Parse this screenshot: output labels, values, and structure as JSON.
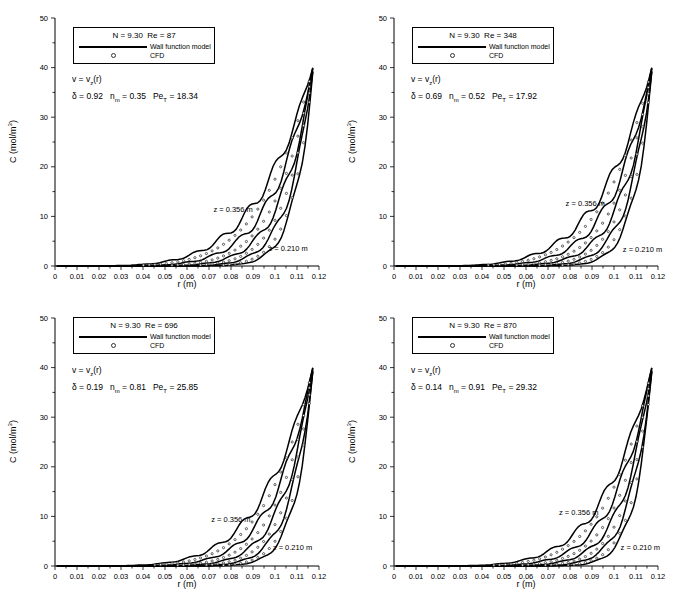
{
  "figure": {
    "background": "#ffffff",
    "ink": "#000000",
    "cfd_marker_color": "#222222"
  },
  "axes": {
    "x": {
      "label": "r (m)",
      "min": 0,
      "max": 0.12,
      "major_tick_step": 0.01,
      "minor_tick_step": 0.005,
      "tick_labels": [
        "0",
        "0.01",
        "0.02",
        "0.03",
        "0.04",
        "0.05",
        "0.06",
        "0.07",
        "0.08",
        "0.09",
        "0.1",
        "0.11",
        "0.12"
      ]
    },
    "y": {
      "label_pre": "C (mol/m",
      "label_sup": "3",
      "label_post": ")",
      "min": 0,
      "max": 50,
      "major_tick_step": 10,
      "minor_tick_step": 5,
      "tick_labels": [
        "0",
        "10",
        "20",
        "30",
        "40",
        "50"
      ]
    }
  },
  "panels": [
    {
      "name": "top-left",
      "legend": {
        "title": "N = 9.30  Re = 87",
        "line_label": "Wall function model",
        "marker_label": "CFD"
      },
      "velocity": {
        "pre": "v = v",
        "sub": "z",
        "post": "(r)"
      },
      "params": {
        "delta": "δ = 0.92",
        "n_pre": "n",
        "n_sub": "m",
        "n_val": " = 0.35",
        "pe_pre": "Pe",
        "pe_sub": "T",
        "pe_val": " = 18.34"
      },
      "annotations": [
        {
          "label": "z = 0.356 m",
          "r": 0.072,
          "c": 11.5
        },
        {
          "label": "z = 0.210 m",
          "r": 0.097,
          "c": 3.6
        }
      ]
    },
    {
      "name": "top-right",
      "legend": {
        "title": "N = 9.30  Re = 348",
        "line_label": "Wall function model",
        "marker_label": "CFD"
      },
      "velocity": {
        "pre": "v = v",
        "sub": "z",
        "post": "(r)"
      },
      "params": {
        "delta": "δ = 0.69",
        "n_pre": "n",
        "n_sub": "m",
        "n_val": " = 0.52",
        "pe_pre": "Pe",
        "pe_sub": "T",
        "pe_val": " = 17.92"
      },
      "annotations": [
        {
          "label": "z = 0.356 m",
          "r": 0.078,
          "c": 12.7
        },
        {
          "label": "z = 0.210 m",
          "r": 0.104,
          "c": 3.4
        }
      ]
    },
    {
      "name": "bottom-left",
      "legend": {
        "title": "N = 9.30  Re = 696",
        "line_label": "Wall function model",
        "marker_label": "CFD"
      },
      "velocity": {
        "pre": "v = v",
        "sub": "z",
        "post": "(r)"
      },
      "params": {
        "delta": "δ = 0.19",
        "n_pre": "n",
        "n_sub": "m",
        "n_val": " = 0.81",
        "pe_pre": "Pe",
        "pe_sub": "T",
        "pe_val": " = 25.85"
      },
      "annotations": [
        {
          "label": "z = 0.356 m",
          "r": 0.071,
          "c": 9.5
        },
        {
          "label": "z = 0.210 m",
          "r": 0.099,
          "c": 3.8
        }
      ]
    },
    {
      "name": "bottom-right",
      "legend": {
        "title": "N = 9.30  Re = 870",
        "line_label": "Wall function model",
        "marker_label": "CFD"
      },
      "velocity": {
        "pre": "v = v",
        "sub": "z",
        "post": "(r)"
      },
      "params": {
        "delta": "δ = 0.14",
        "n_pre": "n",
        "n_sub": "m",
        "n_val": " = 0.91",
        "pe_pre": "Pe",
        "pe_sub": "T",
        "pe_val": " = 29.32"
      },
      "annotations": [
        {
          "label": "z = 0.356 m",
          "r": 0.075,
          "c": 10.9
        },
        {
          "label": "z = 0.210 m",
          "r": 0.103,
          "c": 3.8
        }
      ]
    }
  ],
  "chart_data": [
    {
      "type": "line",
      "title": "N = 9.30  Re = 87",
      "xlabel": "r (m)",
      "ylabel": "C (mol/m3)",
      "xlim": [
        0,
        0.12
      ],
      "ylim": [
        0,
        50
      ],
      "grid": false,
      "legend_position": "top-left",
      "peak_c": 40.5,
      "r_wall": 0.1175,
      "wiggle_amp": 1.3,
      "model_curves": [
        {
          "label": "z = 0.356 m",
          "exponent": 4.5
        },
        {
          "label": "",
          "exponent": 6.0
        },
        {
          "label": "",
          "exponent": 8.0
        },
        {
          "label": "",
          "exponent": 10.5
        },
        {
          "label": "z = 0.210 m",
          "exponent": 14.0
        }
      ],
      "cfd_exponents": [
        5.2,
        7.0,
        9.2,
        12.5
      ]
    },
    {
      "type": "line",
      "title": "N = 9.30  Re = 348",
      "xlabel": "r (m)",
      "ylabel": "C (mol/m3)",
      "xlim": [
        0,
        0.12
      ],
      "ylim": [
        0,
        50
      ],
      "grid": false,
      "legend_position": "top-left",
      "peak_c": 40.5,
      "r_wall": 0.1175,
      "wiggle_amp": 1.3,
      "model_curves": [
        {
          "label": "z = 0.356 m",
          "exponent": 4.7
        },
        {
          "label": "",
          "exponent": 6.2
        },
        {
          "label": "",
          "exponent": 8.2
        },
        {
          "label": "",
          "exponent": 10.8
        },
        {
          "label": "z = 0.210 m",
          "exponent": 14.3
        }
      ],
      "cfd_exponents": [
        5.4,
        7.2,
        9.4,
        12.6
      ]
    },
    {
      "type": "line",
      "title": "N = 9.30  Re = 696",
      "xlabel": "r (m)",
      "ylabel": "C (mol/m3)",
      "xlim": [
        0,
        0.12
      ],
      "ylim": [
        0,
        50
      ],
      "grid": false,
      "legend_position": "top-left",
      "peak_c": 40.5,
      "r_wall": 0.1175,
      "wiggle_amp": 1.2,
      "model_curves": [
        {
          "label": "z = 0.356 m",
          "exponent": 4.9
        },
        {
          "label": "",
          "exponent": 6.4
        },
        {
          "label": "",
          "exponent": 8.5
        },
        {
          "label": "",
          "exponent": 11.2
        },
        {
          "label": "z = 0.210 m",
          "exponent": 14.6
        }
      ],
      "cfd_exponents": [
        5.6,
        7.4,
        9.8,
        13.0
      ]
    },
    {
      "type": "line",
      "title": "N = 9.30  Re = 870",
      "xlabel": "r (m)",
      "ylabel": "C (mol/m3)",
      "xlim": [
        0,
        0.12
      ],
      "ylim": [
        0,
        50
      ],
      "grid": false,
      "legend_position": "top-left",
      "peak_c": 40.5,
      "r_wall": 0.1175,
      "wiggle_amp": 1.2,
      "model_curves": [
        {
          "label": "z = 0.356 m",
          "exponent": 5.1
        },
        {
          "label": "",
          "exponent": 6.7
        },
        {
          "label": "",
          "exponent": 8.8
        },
        {
          "label": "",
          "exponent": 11.6
        },
        {
          "label": "z = 0.210 m",
          "exponent": 15.0
        }
      ],
      "cfd_exponents": [
        5.8,
        7.7,
        10.2,
        13.4
      ]
    }
  ]
}
